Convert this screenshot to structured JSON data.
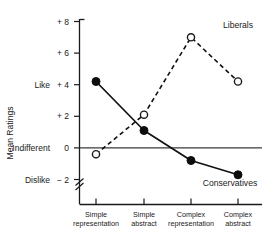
{
  "chart_data": {
    "type": "line",
    "title": "",
    "xlabel": "",
    "ylabel": "Mean Ratings",
    "categories": [
      "Simple representation",
      "Simple abstract",
      "Complex representation",
      "Complex abstract"
    ],
    "category_lines": [
      [
        "Simple",
        "representation"
      ],
      [
        "Simple",
        "abstract"
      ],
      [
        "Complex",
        "representation"
      ],
      [
        "Complex",
        "abstract"
      ]
    ],
    "ylim": [
      -2,
      8
    ],
    "yticks": [
      -2,
      0,
      2,
      4,
      6,
      8
    ],
    "ytick_labels": [
      "− 2",
      "0",
      "+ 2",
      "+ 4",
      "+ 6",
      "+ 8"
    ],
    "y_named_labels": [
      {
        "value": 4,
        "text": "Like"
      },
      {
        "value": 0,
        "text": "Indifferent"
      },
      {
        "value": -2,
        "text": "Dislike"
      }
    ],
    "grid": false,
    "legend_position": "inline-annotations",
    "axis_break": true,
    "zero_reference_line": true,
    "series": [
      {
        "name": "Liberals",
        "values": [
          -0.4,
          2.1,
          7.0,
          4.2
        ],
        "line_style": "dashed",
        "marker": "open-circle",
        "color": "#111111",
        "label_x_category_index": 3,
        "label_value": 7.6
      },
      {
        "name": "Conservatives",
        "values": [
          4.2,
          1.1,
          -0.8,
          -1.7
        ],
        "line_style": "solid",
        "marker": "filled-circle",
        "color": "#111111",
        "label_x_category_index": 3,
        "label_value": -2.4
      }
    ]
  }
}
